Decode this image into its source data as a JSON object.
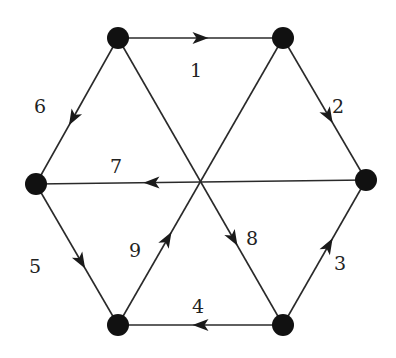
{
  "diagram": {
    "type": "directed-graph",
    "nodes": [
      {
        "id": "TL",
        "x": 118,
        "y": 38
      },
      {
        "id": "TR",
        "x": 283,
        "y": 38
      },
      {
        "id": "R",
        "x": 366,
        "y": 180
      },
      {
        "id": "L",
        "x": 36,
        "y": 184
      },
      {
        "id": "BL",
        "x": 118,
        "y": 325
      },
      {
        "id": "BR",
        "x": 283,
        "y": 325
      }
    ],
    "edges": [
      {
        "label": "1",
        "from": "TL",
        "to": "TR",
        "arrow_t": 0.5,
        "lx": 196,
        "ly": 72
      },
      {
        "label": "2",
        "from": "TR",
        "to": "R",
        "arrow_t": 0.55,
        "lx": 338,
        "ly": 108
      },
      {
        "label": "3",
        "from": "BR",
        "to": "R",
        "arrow_t": 0.55,
        "lx": 340,
        "ly": 265
      },
      {
        "label": "4",
        "from": "BR",
        "to": "BL",
        "arrow_t": 0.5,
        "lx": 198,
        "ly": 308
      },
      {
        "label": "5",
        "from": "L",
        "to": "BL",
        "arrow_t": 0.55,
        "lx": 35,
        "ly": 268
      },
      {
        "label": "6",
        "from": "TL",
        "to": "L",
        "arrow_t": 0.55,
        "lx": 40,
        "ly": 108
      },
      {
        "label": "7",
        "from": "R",
        "to": "L",
        "arrow_t": 0.65,
        "lx": 116,
        "ly": 168
      },
      {
        "label": "8",
        "from": "TL",
        "to": "BR",
        "arrow_t": 0.7,
        "lx": 252,
        "ly": 240
      },
      {
        "label": "9",
        "from": "BL",
        "to": "TR",
        "arrow_t": 0.3,
        "lx": 135,
        "ly": 252
      }
    ]
  }
}
